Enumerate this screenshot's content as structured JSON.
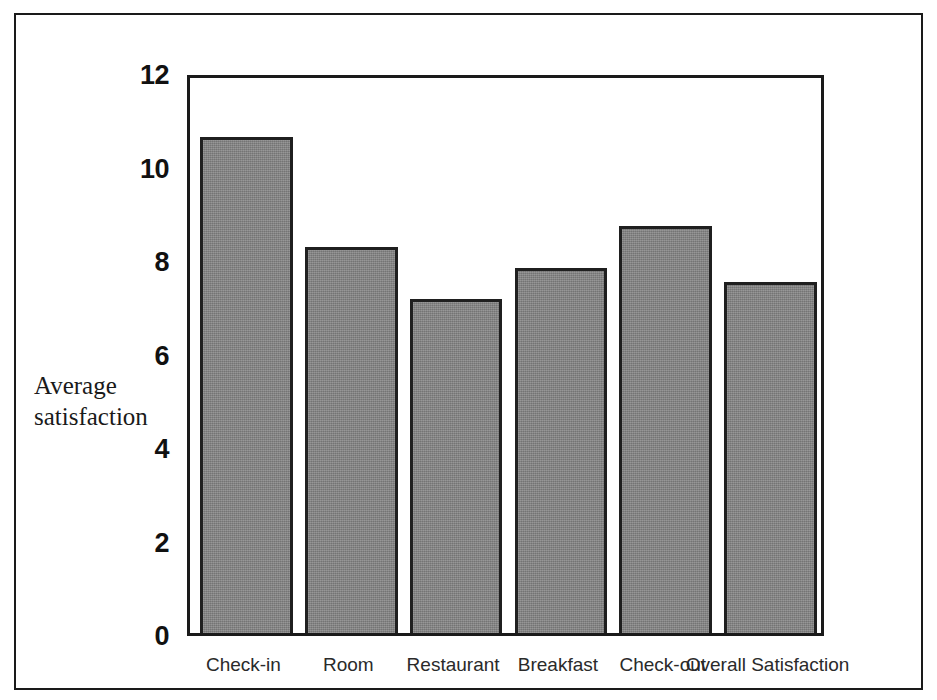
{
  "chart_data": {
    "type": "bar",
    "title": "",
    "subtitle": "",
    "xlabel": "",
    "ylabel": "Average\nsatisfaction",
    "categories": [
      "Check-in",
      "Room",
      "Restaurant",
      "Breakfast",
      "Check-out",
      "Overall Satisfaction"
    ],
    "values": [
      10.6,
      8.25,
      7.15,
      7.8,
      8.7,
      7.5
    ],
    "ylim": [
      0,
      12
    ],
    "yticks": [
      "0",
      "2",
      "4",
      "6",
      "8",
      "10",
      "12"
    ],
    "ytick_values": [
      0,
      2,
      4,
      6,
      8,
      10,
      12
    ],
    "grid": false,
    "legend": false,
    "bar_color": "#828282",
    "bar_edge_color": "#1f1f1f",
    "axis_color": "#1a1a1a",
    "frame_color": "#1a1a1a"
  }
}
